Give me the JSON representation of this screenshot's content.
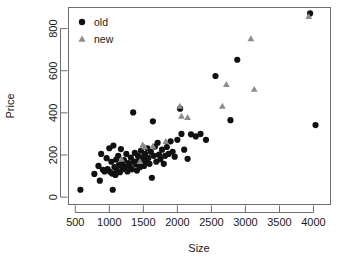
{
  "chart_data": {
    "type": "scatter",
    "title": "",
    "xlabel": "Size",
    "ylabel": "Price",
    "xlim": [
      400,
      4250
    ],
    "ylim": [
      -35,
      900
    ],
    "xticks": [
      500,
      1000,
      1500,
      2000,
      2500,
      3000,
      3500,
      4000
    ],
    "xticklabels": [
      "500",
      "1000",
      "1500",
      "2000",
      "2500",
      "3000",
      "3500",
      "4000"
    ],
    "yticks": [
      0,
      200,
      400,
      600,
      800
    ],
    "yticklabels": [
      "0",
      "200",
      "400",
      "600",
      "800"
    ],
    "grid": false,
    "legend_position": "top-left",
    "series": [
      {
        "name": "old",
        "marker": "circle",
        "color": "#111111",
        "points": [
          [
            575,
            35
          ],
          [
            780,
            110
          ],
          [
            840,
            148
          ],
          [
            860,
            78
          ],
          [
            880,
            205
          ],
          [
            905,
            130
          ],
          [
            930,
            122
          ],
          [
            960,
            185
          ],
          [
            975,
            133
          ],
          [
            1000,
            232
          ],
          [
            1010,
            120
          ],
          [
            1030,
            168
          ],
          [
            1040,
            112
          ],
          [
            1050,
            35
          ],
          [
            1060,
            245
          ],
          [
            1075,
            143
          ],
          [
            1090,
            105
          ],
          [
            1100,
            178
          ],
          [
            1110,
            128
          ],
          [
            1130,
            196
          ],
          [
            1140,
            152
          ],
          [
            1155,
            118
          ],
          [
            1170,
            228
          ],
          [
            1185,
            160
          ],
          [
            1200,
            133
          ],
          [
            1215,
            176
          ],
          [
            1230,
            144
          ],
          [
            1250,
            205
          ],
          [
            1265,
            122
          ],
          [
            1280,
            162
          ],
          [
            1300,
            148
          ],
          [
            1315,
            188
          ],
          [
            1330,
            132
          ],
          [
            1350,
            402
          ],
          [
            1360,
            170
          ],
          [
            1375,
            210
          ],
          [
            1390,
            155
          ],
          [
            1405,
            126
          ],
          [
            1420,
            196
          ],
          [
            1435,
            175
          ],
          [
            1450,
            142
          ],
          [
            1465,
            220
          ],
          [
            1480,
            165
          ],
          [
            1495,
            190
          ],
          [
            1510,
            148
          ],
          [
            1525,
            205
          ],
          [
            1540,
            172
          ],
          [
            1560,
            232
          ],
          [
            1575,
            186
          ],
          [
            1590,
            158
          ],
          [
            1610,
            215
          ],
          [
            1625,
            92
          ],
          [
            1640,
            360
          ],
          [
            1655,
            196
          ],
          [
            1670,
            240
          ],
          [
            1690,
            168
          ],
          [
            1710,
            258
          ],
          [
            1730,
            202
          ],
          [
            1750,
            180
          ],
          [
            1775,
            225
          ],
          [
            1800,
            158
          ],
          [
            1820,
            196
          ],
          [
            1845,
            238
          ],
          [
            1870,
            205
          ],
          [
            1900,
            265
          ],
          [
            1930,
            215
          ],
          [
            1960,
            192
          ],
          [
            2000,
            272
          ],
          [
            2040,
            420
          ],
          [
            2060,
            300
          ],
          [
            2100,
            225
          ],
          [
            2150,
            182
          ],
          [
            2200,
            298
          ],
          [
            2270,
            288
          ],
          [
            2340,
            300
          ],
          [
            2420,
            272
          ],
          [
            2560,
            575
          ],
          [
            2780,
            365
          ],
          [
            2880,
            652
          ],
          [
            3950,
            872
          ],
          [
            4030,
            342
          ]
        ]
      },
      {
        "name": "new",
        "marker": "triangle",
        "color": "#8c8c8c",
        "points": [
          [
            1180,
            180
          ],
          [
            1450,
            170
          ],
          [
            1490,
            248
          ],
          [
            1520,
            238
          ],
          [
            1640,
            242
          ],
          [
            1830,
            265
          ],
          [
            2035,
            432
          ],
          [
            2060,
            385
          ],
          [
            2150,
            378
          ],
          [
            2660,
            432
          ],
          [
            2720,
            535
          ],
          [
            3080,
            752
          ],
          [
            3130,
            512
          ],
          [
            3930,
            858
          ]
        ]
      }
    ]
  },
  "legend": {
    "entries": [
      {
        "label": "old",
        "marker": "circle",
        "color": "#111111"
      },
      {
        "label": "new",
        "marker": "triangle",
        "color": "#8c8c8c"
      }
    ]
  },
  "axes": {
    "x_title": "Size",
    "y_title": "Price"
  }
}
